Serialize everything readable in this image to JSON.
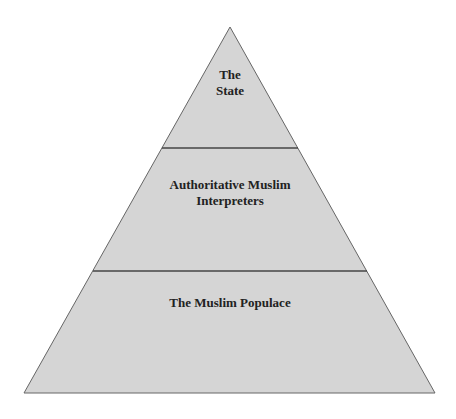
{
  "diagram": {
    "type": "pyramid",
    "colors": {
      "fill": "#d5d5d5",
      "stroke": "#555555",
      "divider": "#444444",
      "text": "#222222"
    },
    "tiers": [
      {
        "level": "top",
        "line1": "The",
        "line2": "State"
      },
      {
        "level": "middle",
        "line1": "Authoritative Muslim",
        "line2": "Interpreters"
      },
      {
        "level": "bottom",
        "line1": "The Muslim Populace"
      }
    ]
  }
}
